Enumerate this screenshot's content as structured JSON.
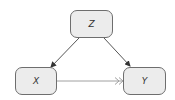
{
  "diagram": {
    "type": "causal-dag",
    "nodes": [
      {
        "id": "Z",
        "label": "Z"
      },
      {
        "id": "X",
        "label": "X"
      },
      {
        "id": "Y",
        "label": "Y"
      }
    ],
    "edges": [
      {
        "from": "Z",
        "to": "X",
        "style": "solid",
        "arrowhead": "filled",
        "color": "#555555"
      },
      {
        "from": "Z",
        "to": "Y",
        "style": "solid",
        "arrowhead": "filled",
        "color": "#555555"
      },
      {
        "from": "X",
        "to": "Y",
        "style": "solid",
        "arrowhead": "double-open",
        "color": "#a0a0a0"
      }
    ]
  },
  "colors": {
    "node_fill": "#ececec",
    "node_border": "#6e6e6e",
    "edge_dark": "#555555",
    "edge_light": "#a0a0a0"
  }
}
